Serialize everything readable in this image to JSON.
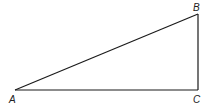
{
  "diagram": {
    "type": "right-triangle",
    "stroke_color": "#1a1a1a",
    "vertices": [
      {
        "name": "A",
        "x": 15,
        "y": 90,
        "label_x": 10,
        "label_y": 103
      },
      {
        "name": "B",
        "x": 198,
        "y": 14,
        "label_x": 194,
        "label_y": 11
      },
      {
        "name": "C",
        "x": 198,
        "y": 90,
        "label_x": 194,
        "label_y": 103
      }
    ],
    "labels": {
      "a": "A",
      "b": "B",
      "c": "C"
    }
  }
}
